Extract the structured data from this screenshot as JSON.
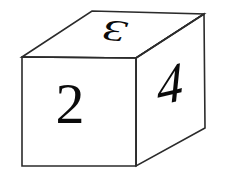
{
  "figure": {
    "background_color": "#ffffff",
    "stroke_color": "#2b2b2b",
    "digit_color": "#0b0b0b"
  },
  "cube": {
    "faces": [
      {
        "id": "front",
        "name": "front-face",
        "digit": "2",
        "points": "22,57 136,58 136,166 22,166"
      },
      {
        "id": "top",
        "name": "top-face",
        "digit": "3",
        "points": "22,57 92,11 204,14 136,58"
      },
      {
        "id": "right",
        "name": "right-face",
        "digit": "4",
        "points": "136,58 204,14 205,128 136,166"
      }
    ],
    "digits": {
      "front": "2",
      "top": "3",
      "right": "4"
    }
  }
}
